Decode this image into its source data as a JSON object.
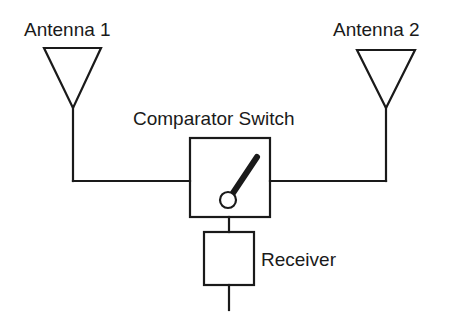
{
  "diagram": {
    "colors": {
      "line": "#1a1a1a",
      "background": "#ffffff"
    },
    "labels": {
      "antenna1": "Antenna 1",
      "antenna2": "Antenna 2",
      "switch": "Comparator Switch",
      "receiver": "Receiver"
    },
    "nodes": [
      {
        "id": "antenna1",
        "type": "antenna-icon"
      },
      {
        "id": "antenna2",
        "type": "antenna-icon"
      },
      {
        "id": "switch",
        "type": "switch-box"
      },
      {
        "id": "receiver",
        "type": "receiver-box"
      }
    ],
    "edges": [
      {
        "from": "antenna1",
        "to": "switch"
      },
      {
        "from": "antenna2",
        "to": "switch"
      },
      {
        "from": "switch",
        "to": "receiver"
      }
    ]
  }
}
